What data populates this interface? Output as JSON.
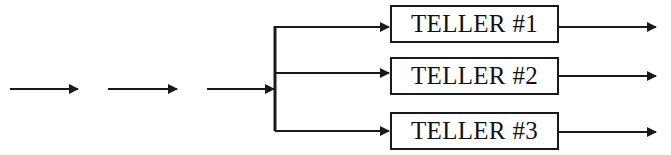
{
  "diagram": {
    "type": "queueing-flow",
    "stroke_color": "#1a1a1a",
    "background": "#ffffff",
    "input_arrows": [
      {
        "x1": 10,
        "x2": 78,
        "y": 89
      },
      {
        "x1": 108,
        "x2": 177,
        "y": 89
      },
      {
        "x1": 207,
        "x2": 274,
        "y": 89
      }
    ],
    "splitter": {
      "x": 275,
      "y_top": 26,
      "y_bottom": 131
    },
    "servers": [
      {
        "label": "TELLER #1",
        "box": {
          "x": 390,
          "y": 5,
          "w": 169,
          "h": 38
        },
        "branch_y": 27,
        "out_y": 27
      },
      {
        "label": "TELLER #2",
        "box": {
          "x": 390,
          "y": 57,
          "w": 169,
          "h": 38
        },
        "branch_y": 73,
        "out_y": 76
      },
      {
        "label": "TELLER #3",
        "box": {
          "x": 390,
          "y": 112,
          "w": 169,
          "h": 38
        },
        "branch_y": 131,
        "out_y": 132
      }
    ],
    "output_arrow_end_x": 656
  }
}
